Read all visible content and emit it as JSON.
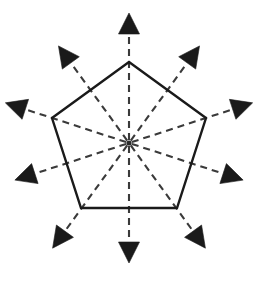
{
  "figure": {
    "background_color": "#ffffff",
    "outline_color": "#1a1a1a",
    "ray_color": "#3a3a3a",
    "arrow_color": "#1a1a1a",
    "center": {
      "x": 129,
      "y": 143
    },
    "center_label": "center-point",
    "pentagon": {
      "name": "regular-pentagon",
      "sides": 5,
      "circumradius": 81,
      "stroke_width": 2.4,
      "vertices": [
        {
          "label": "vertex-top",
          "x": 129,
          "y": 62
        },
        {
          "label": "vertex-upper-right",
          "x": 206,
          "y": 118
        },
        {
          "label": "vertex-lower-right",
          "x": 177,
          "y": 208
        },
        {
          "label": "vertex-lower-left",
          "x": 81,
          "y": 208
        },
        {
          "label": "vertex-upper-left",
          "x": 52,
          "y": 118
        }
      ]
    },
    "rays": [
      {
        "label": "ray-vertex-n",
        "kind": "vertex",
        "angle_deg": 90,
        "tip_radius": 130,
        "arrow_size": 21
      },
      {
        "label": "ray-mid-ne",
        "kind": "midpoint",
        "angle_deg": 54,
        "tip_radius": 120,
        "arrow_size": 21
      },
      {
        "label": "ray-vertex-ene",
        "kind": "vertex",
        "angle_deg": 18,
        "tip_radius": 130,
        "arrow_size": 21
      },
      {
        "label": "ray-mid-ese",
        "kind": "midpoint",
        "angle_deg": 342,
        "tip_radius": 120,
        "arrow_size": 21
      },
      {
        "label": "ray-vertex-sse",
        "kind": "vertex",
        "angle_deg": 306,
        "tip_radius": 130,
        "arrow_size": 21
      },
      {
        "label": "ray-mid-s",
        "kind": "midpoint",
        "angle_deg": 270,
        "tip_radius": 120,
        "arrow_size": 21
      },
      {
        "label": "ray-vertex-ssw",
        "kind": "vertex",
        "angle_deg": 234,
        "tip_radius": 130,
        "arrow_size": 21
      },
      {
        "label": "ray-mid-wsw",
        "kind": "midpoint",
        "angle_deg": 198,
        "tip_radius": 120,
        "arrow_size": 21
      },
      {
        "label": "ray-vertex-wnw",
        "kind": "vertex",
        "angle_deg": 162,
        "tip_radius": 130,
        "arrow_size": 21
      },
      {
        "label": "ray-mid-nw",
        "kind": "midpoint",
        "angle_deg": 126,
        "tip_radius": 120,
        "arrow_size": 21
      }
    ]
  }
}
